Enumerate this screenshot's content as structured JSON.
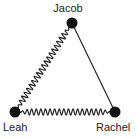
{
  "diagram": {
    "type": "graph",
    "background_color": "#ffffff",
    "stroke_color": "#1a1a1a",
    "node_color": "#111111",
    "nodes": [
      {
        "id": "jacob",
        "label": "Jacob",
        "x": 72,
        "y": 23,
        "radius": 5.5,
        "label_position": "above"
      },
      {
        "id": "leah",
        "label": "Leah",
        "x": 15,
        "y": 112,
        "radius": 5.5,
        "label_position": "below-left"
      },
      {
        "id": "rachel",
        "label": "Rachel",
        "x": 115,
        "y": 112,
        "radius": 5.5,
        "label_position": "below-right"
      }
    ],
    "edges": [
      {
        "id": "jacob-leah",
        "from": "jacob",
        "to": "leah",
        "style": "wavy",
        "amplitude": 3.0,
        "wavelength": 4.6
      },
      {
        "id": "leah-rachel",
        "from": "leah",
        "to": "rachel",
        "style": "wavy",
        "amplitude": 3.0,
        "wavelength": 4.6
      },
      {
        "id": "jacob-rachel",
        "from": "jacob",
        "to": "rachel",
        "style": "straight",
        "amplitude": 0,
        "wavelength": 0
      }
    ],
    "labels": {
      "jacob": "Jacob",
      "leah": "Leah",
      "rachel": "Rachel"
    }
  }
}
